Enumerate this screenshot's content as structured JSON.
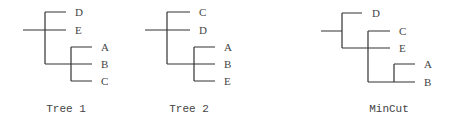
{
  "trees": [
    {
      "caption": "Tree 1",
      "topology": "((D,E),(A,B,C))",
      "leaves": [
        "D",
        "E",
        "A",
        "B",
        "C"
      ]
    },
    {
      "caption": "Tree 2",
      "topology": "((C,D),(A,B,E))",
      "leaves": [
        "C",
        "D",
        "A",
        "B",
        "E"
      ]
    },
    {
      "caption": "MinCut",
      "topology": "(D,(C,E,(A,B)))",
      "leaves": [
        "D",
        "C",
        "E",
        "A",
        "B"
      ]
    }
  ],
  "colors": {
    "line": "#333333",
    "text": "#444444",
    "background": "#ffffff"
  }
}
